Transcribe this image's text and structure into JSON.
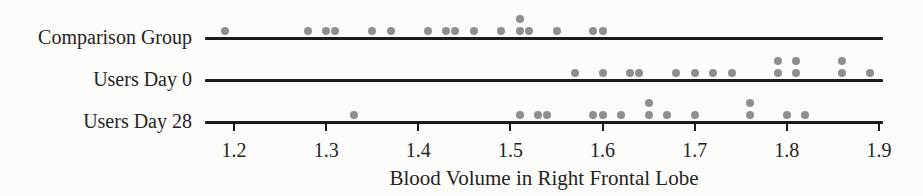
{
  "chart_data": {
    "type": "scatter",
    "subtype": "dotplot",
    "title": "",
    "xlabel": "Blood Volume in Right Frontal Lobe",
    "ylabel": "",
    "xlim": [
      1.15,
      1.93
    ],
    "x_tick_labels": [
      "1.2",
      "1.3",
      "1.4",
      "1.5",
      "1.6",
      "1.7",
      "1.8",
      "1.9"
    ],
    "grid": "off",
    "legend": "none",
    "series": [
      {
        "name": "Comparison Group",
        "values": [
          1.19,
          1.28,
          1.3,
          1.31,
          1.35,
          1.37,
          1.41,
          1.43,
          1.44,
          1.46,
          1.49,
          1.51,
          1.51,
          1.52,
          1.55,
          1.59,
          1.6
        ]
      },
      {
        "name": "Users Day 0",
        "values": [
          1.57,
          1.6,
          1.63,
          1.64,
          1.68,
          1.7,
          1.72,
          1.74,
          1.79,
          1.79,
          1.81,
          1.81,
          1.86,
          1.86,
          1.89
        ]
      },
      {
        "name": "Users Day 28",
        "values": [
          1.33,
          1.51,
          1.53,
          1.54,
          1.59,
          1.6,
          1.62,
          1.65,
          1.65,
          1.67,
          1.7,
          1.76,
          1.76,
          1.8,
          1.82
        ]
      }
    ]
  },
  "colors": {
    "dot": "#8e8e8e",
    "line": "#1b1b1b",
    "text": "#242424",
    "background": "#fcfcfa"
  }
}
